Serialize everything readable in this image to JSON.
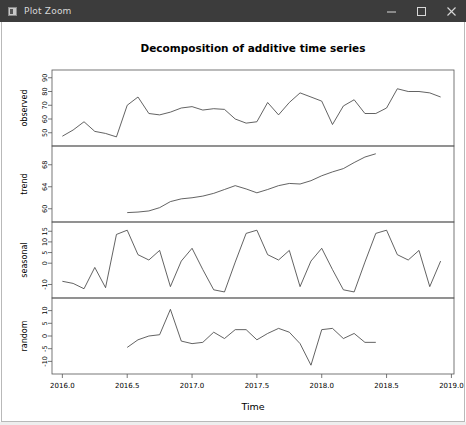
{
  "window": {
    "title": "Plot Zoom",
    "icon": "plot-window-icon",
    "minimize_label": "–",
    "maximize_label": "□",
    "close_label": "×"
  },
  "chart_data": {
    "type": "line",
    "title": "Decomposition of additive time series",
    "xlabel": "Time",
    "ylabel": "",
    "grid": false,
    "legend": "none",
    "xlim": [
      2015.92,
      2019.02
    ],
    "xticks": [
      "2016.0",
      "2016.5",
      "2017.0",
      "2017.5",
      "2018.0",
      "2018.5",
      "2019.0"
    ],
    "xtick_values": [
      2016.0,
      2016.5,
      2017.0,
      2017.5,
      2018.0,
      2018.5,
      2019.0
    ],
    "panels": [
      {
        "name": "observed",
        "ylabel": "observed",
        "ylim": [
          44,
          92
        ],
        "yticks": [
          "50",
          "60",
          "70",
          "80",
          "90"
        ],
        "ytick_values": [
          50,
          60,
          70,
          80,
          90
        ],
        "x": [
          2016.0,
          2016.083,
          2016.167,
          2016.25,
          2016.333,
          2016.417,
          2016.5,
          2016.583,
          2016.667,
          2016.75,
          2016.833,
          2016.917,
          2017.0,
          2017.083,
          2017.167,
          2017.25,
          2017.333,
          2017.417,
          2017.5,
          2017.583,
          2017.667,
          2017.75,
          2017.833,
          2017.917,
          2018.0,
          2018.083,
          2018.167,
          2018.25,
          2018.333,
          2018.417,
          2018.5,
          2018.583,
          2018.667,
          2018.75,
          2018.833,
          2018.917
        ],
        "values": [
          47.5,
          52.0,
          58.0,
          51.0,
          49.5,
          47.0,
          70.0,
          76.0,
          64.0,
          63.0,
          65.0,
          68.0,
          69.0,
          66.5,
          67.5,
          67.0,
          60.0,
          57.0,
          58.0,
          72.0,
          63.0,
          72.0,
          79.0,
          76.0,
          73.0,
          56.0,
          69.5,
          74.0,
          64.0,
          64.0,
          68.0,
          82.0,
          80.0,
          80.0,
          79.0,
          76.0
        ]
      },
      {
        "name": "trend",
        "ylabel": "trend",
        "ylim": [
          58.5,
          70.5
        ],
        "yticks": [
          "60",
          "64",
          "68"
        ],
        "ytick_values": [
          60,
          64,
          68
        ],
        "x": [
          2016.5,
          2016.583,
          2016.667,
          2016.75,
          2016.833,
          2016.917,
          2017.0,
          2017.083,
          2017.167,
          2017.25,
          2017.333,
          2017.417,
          2017.5,
          2017.583,
          2017.667,
          2017.75,
          2017.833,
          2017.917,
          2018.0,
          2018.083,
          2018.167,
          2018.25,
          2018.333,
          2018.417
        ],
        "values": [
          59.3,
          59.4,
          59.6,
          60.2,
          61.3,
          61.8,
          62.0,
          62.3,
          62.8,
          63.5,
          64.2,
          63.6,
          62.9,
          63.5,
          64.2,
          64.6,
          64.5,
          65.1,
          66.0,
          66.7,
          67.3,
          68.4,
          69.4,
          70.0
        ]
      },
      {
        "name": "seasonal",
        "ylabel": "seasonal",
        "ylim": [
          -14,
          17
        ],
        "yticks": [
          "-10",
          "0",
          "5",
          "10",
          "15"
        ],
        "ytick_values": [
          -10,
          0,
          5,
          10,
          15
        ],
        "x": [
          2016.0,
          2016.083,
          2016.167,
          2016.25,
          2016.333,
          2016.417,
          2016.5,
          2016.583,
          2016.667,
          2016.75,
          2016.833,
          2016.917,
          2017.0,
          2017.083,
          2017.167,
          2017.25,
          2017.333,
          2017.417,
          2017.5,
          2017.583,
          2017.667,
          2017.75,
          2017.833,
          2017.917,
          2018.0,
          2018.083,
          2018.167,
          2018.25,
          2018.333,
          2018.417,
          2018.5,
          2018.583,
          2018.667,
          2018.75,
          2018.833,
          2018.917
        ],
        "values": [
          -8.5,
          -9.5,
          -12.0,
          -2.0,
          -11.5,
          13.5,
          15.5,
          4.0,
          1.5,
          6.0,
          -11.0,
          1.0,
          7.0,
          -3.0,
          -12.5,
          -13.5,
          0.5,
          14.0,
          15.5,
          4.0,
          1.5,
          6.0,
          -11.0,
          1.0,
          7.0,
          -3.0,
          -12.5,
          -13.5,
          0.5,
          14.0,
          15.5,
          4.0,
          1.5,
          6.0,
          -11.0,
          1.0
        ]
      },
      {
        "name": "random",
        "ylabel": "random",
        "ylim": [
          -13,
          13
        ],
        "yticks": [
          "-10",
          "-5",
          "0",
          "5",
          "10"
        ],
        "ytick_values": [
          -10,
          -5,
          0,
          5,
          10
        ],
        "x": [
          2016.5,
          2016.583,
          2016.667,
          2016.75,
          2016.833,
          2016.917,
          2017.0,
          2017.083,
          2017.167,
          2017.25,
          2017.333,
          2017.417,
          2017.5,
          2017.583,
          2017.667,
          2017.75,
          2017.833,
          2017.917,
          2018.0,
          2018.083,
          2018.167,
          2018.25,
          2018.333,
          2018.417
        ],
        "values": [
          -4.5,
          -1.5,
          0.0,
          0.5,
          10.5,
          -2.0,
          -3.0,
          -2.5,
          1.5,
          -1.0,
          2.5,
          2.5,
          -1.5,
          1.0,
          3.0,
          1.5,
          -3.0,
          -11.5,
          2.5,
          3.0,
          -1.0,
          1.0,
          -2.5,
          -2.5
        ]
      }
    ]
  }
}
